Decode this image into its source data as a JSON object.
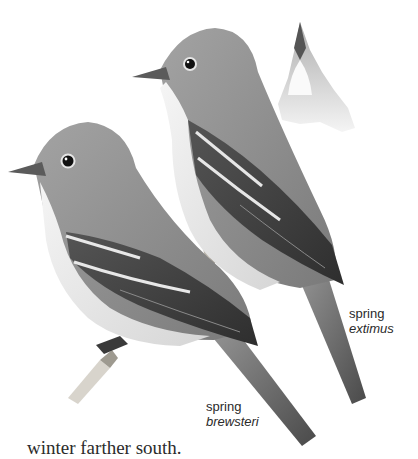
{
  "plate": {
    "subject": "Willow Flycatcher illustration",
    "figures": [
      {
        "id": "extimus",
        "season": "spring",
        "subspecies": "extimus"
      },
      {
        "id": "brewsteri",
        "season": "spring",
        "subspecies": "brewsteri"
      },
      {
        "id": "bill-detail",
        "view": "underside of bill"
      }
    ],
    "colors": {
      "plumage_gray": "#8a8a8a",
      "dark_wing": "#3c3c3c",
      "pale_belly": "#ececec",
      "eye": "#111111"
    }
  },
  "labels": {
    "extimus": {
      "season": "spring",
      "subspecies": "extimus"
    },
    "brewsteri": {
      "season": "spring",
      "subspecies": "brewsteri"
    }
  },
  "body": {
    "text": "winter farther south."
  }
}
